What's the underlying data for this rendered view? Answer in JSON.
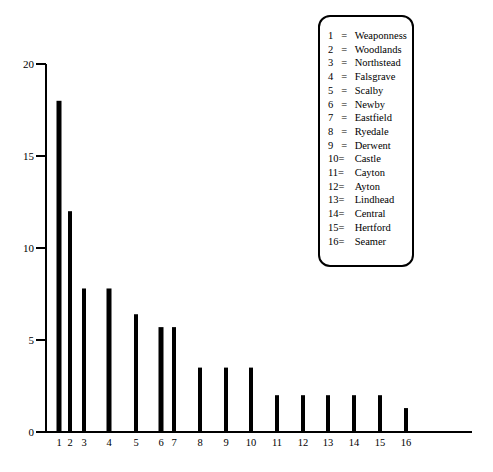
{
  "chart_data": {
    "type": "bar",
    "title": "",
    "xlabel": "",
    "ylabel": "",
    "ylim": [
      0,
      20
    ],
    "yticks": [
      0,
      5,
      10,
      15,
      20
    ],
    "grid": false,
    "legend_position": "top-right",
    "categories": [
      "1",
      "2",
      "3",
      "4",
      "5",
      "6",
      "7",
      "8",
      "9",
      "10",
      "11",
      "12",
      "13",
      "14",
      "15",
      "16"
    ],
    "values": [
      18,
      12,
      7.8,
      7.8,
      6.4,
      5.7,
      5.7,
      3.5,
      3.5,
      3.5,
      2,
      2,
      2,
      2,
      2,
      1.3
    ],
    "legend": [
      {
        "num": "1",
        "sep": "=",
        "name": "Weaponness"
      },
      {
        "num": "2",
        "sep": "=",
        "name": "Woodlands"
      },
      {
        "num": "3",
        "sep": "=",
        "name": "Northstead"
      },
      {
        "num": "4",
        "sep": "=",
        "name": "Falsgrave"
      },
      {
        "num": "5",
        "sep": "=",
        "name": "Scalby"
      },
      {
        "num": "6",
        "sep": "=",
        "name": "Newby"
      },
      {
        "num": "7",
        "sep": "=",
        "name": "Eastfield"
      },
      {
        "num": "8",
        "sep": "=",
        "name": "Ryedale"
      },
      {
        "num": "9",
        "sep": "=",
        "name": "Derwent"
      },
      {
        "num": "10",
        "sep": "=",
        "name": "Castle"
      },
      {
        "num": "11",
        "sep": "=",
        "name": "Cayton"
      },
      {
        "num": "12",
        "sep": "=",
        "name": "Ayton"
      },
      {
        "num": "13",
        "sep": "=",
        "name": "Lindhead"
      },
      {
        "num": "14",
        "sep": "=",
        "name": "Central"
      },
      {
        "num": "15",
        "sep": "=",
        "name": "Hertford"
      },
      {
        "num": "16",
        "sep": "=",
        "name": "Seamer"
      }
    ]
  },
  "layout": {
    "bar_x": [
      59,
      70,
      84,
      109,
      136,
      161,
      174,
      200,
      226,
      251,
      277,
      303,
      328,
      354,
      380,
      406
    ],
    "bar_widths": [
      5,
      4,
      4,
      5,
      4,
      5,
      4,
      4,
      4,
      4,
      4,
      4,
      4,
      4,
      4,
      4
    ],
    "axis_x": 46,
    "baseline_y": 432,
    "top_y": 64,
    "axis_end_x": 472,
    "bar_color": "#000000"
  }
}
